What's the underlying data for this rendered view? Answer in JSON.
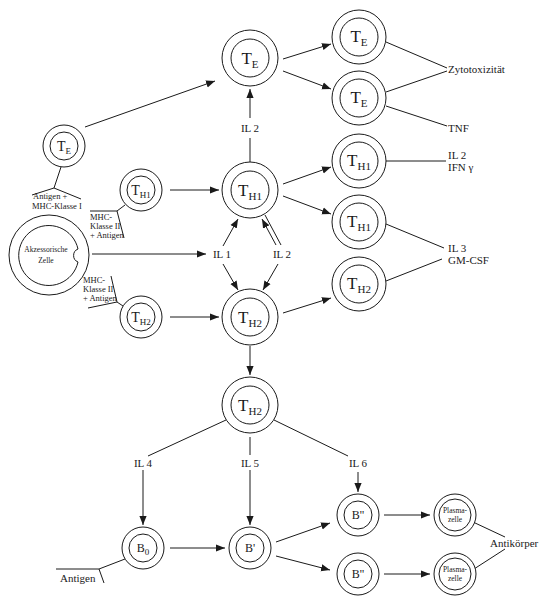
{
  "diagram": {
    "type": "immune-cell-interaction-flow",
    "colors": {
      "stroke": "#1a1a1a",
      "background": "#ffffff"
    },
    "cells": {
      "te_top": {
        "main": "T",
        "sub": "E"
      },
      "te_right_1": {
        "main": "T",
        "sub": "E"
      },
      "te_right_2": {
        "main": "T",
        "sub": "E"
      },
      "te_left": {
        "main": "T",
        "sub": "E"
      },
      "th1_center": {
        "main": "T",
        "sub": "H1"
      },
      "th1_left": {
        "main": "T",
        "sub": "H1"
      },
      "th1_right_1": {
        "main": "T",
        "sub": "H1"
      },
      "th1_right_2": {
        "main": "T",
        "sub": "H1"
      },
      "th2_center": {
        "main": "T",
        "sub": "H2"
      },
      "th2_left": {
        "main": "T",
        "sub": "H2"
      },
      "th2_right": {
        "main": "T",
        "sub": "H2"
      },
      "th2_lower": {
        "main": "T",
        "sub": "H2"
      },
      "accessory": {
        "line1": "Akzessorische",
        "line2": "Zelle"
      },
      "b0": {
        "main": "B",
        "sub": "0"
      },
      "b_prime": {
        "main": "B'"
      },
      "b_double_1": {
        "main": "B''"
      },
      "b_double_2": {
        "main": "B''"
      },
      "plasma_1": {
        "line1": "Plasma-",
        "line2": "zelle"
      },
      "plasma_2": {
        "line1": "Plasma-",
        "line2": "zelle"
      }
    },
    "labels": {
      "il2_top": "IL 2",
      "il1": "IL 1",
      "il2_mid": "IL 2",
      "il4": "IL 4",
      "il5": "IL 5",
      "il6": "IL 6",
      "zytotoxizitaet": "Zytotoxizität",
      "tnf": "TNF",
      "il2_ifn_line1": "IL 2",
      "il2_ifn_line2": "IFN γ",
      "il3_line1": "IL 3",
      "il3_line2": "GM-CSF",
      "antigen_mhc1_line1": "Antigen +",
      "antigen_mhc1_line2": "MHC-Klasse I",
      "mhc2_top_line1": "MHC-",
      "mhc2_top_line2": "Klasse II",
      "mhc2_top_line3": "+ Antigen",
      "mhc2_bottom_line1": "MHC-",
      "mhc2_bottom_line2": "Klasse II",
      "mhc2_bottom_line3": "+ Antigen",
      "antigen_b": "Antigen",
      "antikoerper": "Antikörper"
    }
  }
}
